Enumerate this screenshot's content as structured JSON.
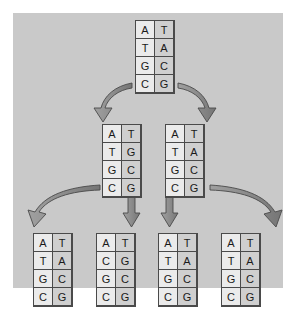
{
  "figure": {
    "background_color": "#c9c9c9",
    "canvas_color": "#ffffff",
    "strand_left_column_color": "#ebebeb",
    "strand_right_column_color": "#cfcfcf",
    "arrow_color": "#8c8c8c",
    "arrow_outline_color": "#4a4a4a",
    "border_color": "#4a4a4a",
    "text_color": "#1a1a1a"
  },
  "backdrop": {
    "x": 13,
    "y": 13,
    "width": 270,
    "height": 275
  },
  "generations": [
    {
      "name": "generation-0",
      "strands": [
        {
          "id": "strand-g0",
          "x": 135,
          "y": 20,
          "pairs": [
            {
              "left": "A",
              "right": "T"
            },
            {
              "left": "T",
              "right": "A"
            },
            {
              "left": "G",
              "right": "C"
            },
            {
              "left": "C",
              "right": "G"
            }
          ]
        }
      ]
    },
    {
      "name": "generation-1",
      "strands": [
        {
          "id": "strand-g1-left",
          "x": 102,
          "y": 124,
          "pairs": [
            {
              "left": "A",
              "right": "T"
            },
            {
              "left": "T",
              "right": "G"
            },
            {
              "left": "G",
              "right": "C"
            },
            {
              "left": "C",
              "right": "G"
            }
          ]
        },
        {
          "id": "strand-g1-right",
          "x": 165,
          "y": 124,
          "pairs": [
            {
              "left": "A",
              "right": "T"
            },
            {
              "left": "T",
              "right": "A"
            },
            {
              "left": "G",
              "right": "C"
            },
            {
              "left": "C",
              "right": "G"
            }
          ]
        }
      ]
    },
    {
      "name": "generation-2",
      "strands": [
        {
          "id": "strand-g2-1",
          "x": 33,
          "y": 233,
          "pairs": [
            {
              "left": "A",
              "right": "T"
            },
            {
              "left": "T",
              "right": "A"
            },
            {
              "left": "G",
              "right": "C"
            },
            {
              "left": "C",
              "right": "G"
            }
          ]
        },
        {
          "id": "strand-g2-2",
          "x": 96,
          "y": 233,
          "pairs": [
            {
              "left": "A",
              "right": "T"
            },
            {
              "left": "C",
              "right": "G"
            },
            {
              "left": "G",
              "right": "C"
            },
            {
              "left": "C",
              "right": "G"
            }
          ]
        },
        {
          "id": "strand-g2-3",
          "x": 158,
          "y": 233,
          "pairs": [
            {
              "left": "A",
              "right": "T"
            },
            {
              "left": "T",
              "right": "A"
            },
            {
              "left": "G",
              "right": "C"
            },
            {
              "left": "C",
              "right": "G"
            }
          ]
        },
        {
          "id": "strand-g2-4",
          "x": 221,
          "y": 233,
          "pairs": [
            {
              "left": "A",
              "right": "T"
            },
            {
              "left": "T",
              "right": "A"
            },
            {
              "left": "G",
              "right": "C"
            },
            {
              "left": "C",
              "right": "G"
            }
          ]
        }
      ]
    }
  ],
  "arrows": [
    {
      "id": "arrow-g0-to-g1-left",
      "kind": "curved-left",
      "from": "strand-g0",
      "to": "strand-g1-left"
    },
    {
      "id": "arrow-g0-to-g1-right",
      "kind": "curved-right",
      "from": "strand-g0",
      "to": "strand-g1-right"
    },
    {
      "id": "arrow-g1-left-to-g2-1",
      "kind": "curved-left",
      "from": "strand-g1-left",
      "to": "strand-g2-1"
    },
    {
      "id": "arrow-g1-left-to-g2-2",
      "kind": "straight-down",
      "from": "strand-g1-left",
      "to": "strand-g2-2"
    },
    {
      "id": "arrow-g1-right-to-g2-3",
      "kind": "straight-down",
      "from": "strand-g1-right",
      "to": "strand-g2-3"
    },
    {
      "id": "arrow-g1-right-to-g2-4",
      "kind": "curved-right",
      "from": "strand-g1-right",
      "to": "strand-g2-4"
    }
  ]
}
